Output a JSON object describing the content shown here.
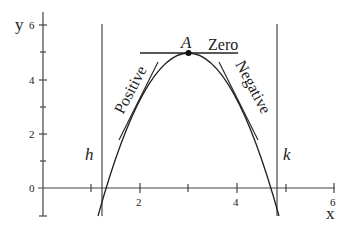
{
  "diagram": {
    "axes": {
      "x_label": "x",
      "y_label": "y",
      "x_ticks": [
        {
          "value": 2,
          "label": "2"
        },
        {
          "value": 4,
          "label": "4"
        },
        {
          "value": 6,
          "label": "6"
        }
      ],
      "y_ticks": [
        {
          "value": 0,
          "label": "0"
        },
        {
          "value": 2,
          "label": "2"
        },
        {
          "value": 4,
          "label": "4"
        },
        {
          "value": 6,
          "label": "6"
        }
      ]
    },
    "point": {
      "label": "A",
      "x": 3,
      "y": 5
    },
    "tangents": {
      "zero": "Zero",
      "positive": "Positive",
      "negative": "Negative"
    },
    "vertical_lines": {
      "left": "h",
      "right": "k"
    },
    "colors": {
      "ink": "#222222",
      "axis": "#444444",
      "background": "#ffffff"
    }
  }
}
